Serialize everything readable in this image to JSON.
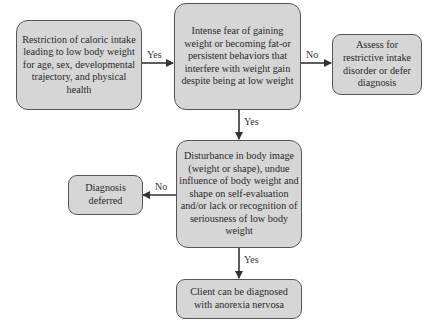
{
  "nodes": {
    "restriction": "Restriction of caloric intake leading to low body weight for age, sex, developmental trajectory, and physical health",
    "fear": "Intense fear of gaining weight or becoming fat-or persistent behaviors that interfere with weight gain despite being at low weight",
    "assess": "Assess for restrictive intake disorder or defer diagnosis",
    "disturbance": "Disturbance in body image (weight or shape), undue influence of body weight and shape on self-evaluation and/or lack or recognition of seriousness of low body weight",
    "deferred": "Diagnosis deferred",
    "diagnosed": "Client can be diagnosed with anorexia nervosa"
  },
  "edges": {
    "restriction_to_fear": "Yes",
    "fear_to_assess": "No",
    "fear_to_disturbance": "Yes",
    "disturbance_to_deferred": "No",
    "disturbance_to_diagnosed": "Yes"
  },
  "colors": {
    "box_fill": "#d6d6d6",
    "box_border": "#555555",
    "arrow": "#333333"
  }
}
